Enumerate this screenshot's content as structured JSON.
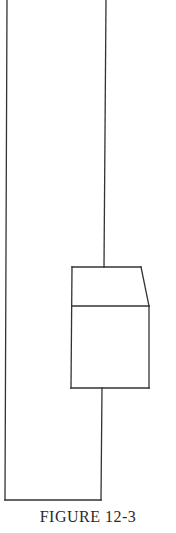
{
  "figure": {
    "caption": "FIGURE 12-3",
    "line_color": "#333333",
    "background": "#ffffff"
  },
  "diagram": {
    "elements": [
      {
        "name": "left-vertical-line",
        "from": [
          7,
          0
        ],
        "to": [
          5,
          500
        ]
      },
      {
        "name": "top-vertical-line",
        "from": [
          106,
          0
        ],
        "to": [
          104,
          267
        ]
      },
      {
        "name": "box-top-edge",
        "from": [
          72,
          267
        ],
        "to": [
          141,
          267
        ]
      },
      {
        "name": "box-slanted-edge",
        "from": [
          141,
          267
        ],
        "to": [
          149,
          306
        ]
      },
      {
        "name": "box-divider-line",
        "from": [
          72,
          306
        ],
        "to": [
          149,
          306
        ]
      },
      {
        "name": "box-left-edge",
        "from": [
          72,
          267
        ],
        "to": [
          71,
          388
        ]
      },
      {
        "name": "box-right-edge",
        "from": [
          149,
          306
        ],
        "to": [
          149,
          388
        ]
      },
      {
        "name": "box-bottom-edge",
        "from": [
          71,
          388
        ],
        "to": [
          149,
          388
        ]
      },
      {
        "name": "bottom-connector-line",
        "from": [
          102,
          388
        ],
        "to": [
          101,
          500
        ]
      },
      {
        "name": "bottom-horizontal-line",
        "from": [
          5,
          500
        ],
        "to": [
          101,
          500
        ]
      }
    ]
  }
}
